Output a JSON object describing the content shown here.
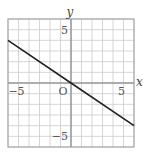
{
  "chart_data": {
    "type": "line",
    "title": "",
    "xlabel": "x",
    "ylabel": "y",
    "xlim": [
      -6,
      6
    ],
    "ylim": [
      -6,
      6
    ],
    "grid": true,
    "x_ticks": [
      -5,
      5
    ],
    "y_ticks": [
      5,
      -5
    ],
    "origin_label": "O",
    "series": [
      {
        "name": "line",
        "x": [
          -6,
          0,
          6
        ],
        "y": [
          4,
          0,
          -4
        ],
        "color": "#222222"
      }
    ]
  },
  "labels": {
    "x_axis": "x",
    "y_axis": "y",
    "origin": "O",
    "x_neg": "−5",
    "x_pos": "5",
    "y_pos": "5",
    "y_neg": "−5"
  },
  "colors": {
    "grid": "#cccccc",
    "axis": "#999999",
    "line": "#222222",
    "border": "#aaaaaa"
  }
}
